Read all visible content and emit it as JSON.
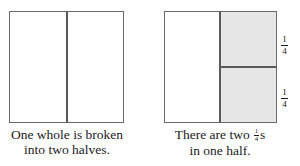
{
  "left_figure": {
    "caption_line1": "One whole is broken",
    "caption_line2": "into two halves.",
    "parts": 2
  },
  "right_figure": {
    "caption_pre": "There are two",
    "caption_frac_num": "1",
    "caption_frac_den": "4",
    "caption_post": "s",
    "caption_line2": "in one half.",
    "labels": [
      {
        "num": "1",
        "den": "4"
      },
      {
        "num": "1",
        "den": "4"
      }
    ],
    "shade_color": "#e6e6e6"
  }
}
